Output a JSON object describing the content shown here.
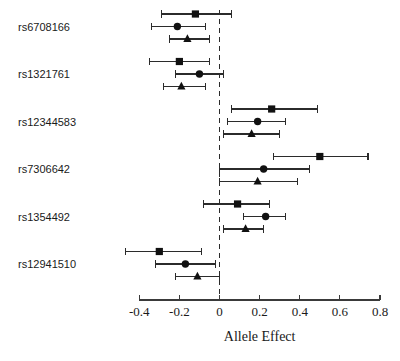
{
  "chart_data": {
    "type": "scatter",
    "subtype": "forest-plot",
    "title": "",
    "xlabel": "Allele Effect",
    "ylabel": "",
    "xlim": [
      -0.5,
      0.8
    ],
    "xticks": [
      -0.4,
      -0.2,
      0,
      0.2,
      0.4,
      0.6,
      0.8
    ],
    "xtick_labels": [
      "-0.4",
      "-0.2",
      "0",
      "0.2",
      "0.4",
      "0.6",
      "0.8"
    ],
    "grid": false,
    "legend": "none",
    "reference_line": {
      "x": 0,
      "style": "dashed"
    },
    "categories": [
      "rs6708166",
      "rs1321761",
      "rs12344583",
      "rs7306642",
      "rs1354492",
      "rs12941510"
    ],
    "series": [
      {
        "name": "square",
        "marker": "square",
        "values": [
          -0.12,
          -0.2,
          0.26,
          0.5,
          0.09,
          -0.3
        ],
        "ci_low": [
          -0.29,
          -0.35,
          0.06,
          0.27,
          -0.08,
          -0.47
        ],
        "ci_high": [
          0.06,
          -0.05,
          0.49,
          0.74,
          0.25,
          -0.09
        ]
      },
      {
        "name": "circle",
        "marker": "circle",
        "values": [
          -0.21,
          -0.1,
          0.19,
          0.22,
          0.23,
          -0.17
        ],
        "ci_low": [
          -0.34,
          -0.22,
          0.04,
          0.0,
          0.12,
          -0.32
        ],
        "ci_high": [
          -0.07,
          0.02,
          0.33,
          0.45,
          0.33,
          -0.02
        ]
      },
      {
        "name": "triangle",
        "marker": "triangle",
        "values": [
          -0.16,
          -0.19,
          0.16,
          0.19,
          0.13,
          -0.11
        ],
        "ci_low": [
          -0.25,
          -0.28,
          0.02,
          0.0,
          0.02,
          -0.22
        ],
        "ci_high": [
          -0.05,
          -0.07,
          0.3,
          0.39,
          0.22,
          0.0
        ]
      }
    ],
    "colors": {
      "marker": "#111111",
      "whisker": "#2b2b2b",
      "axis": "#3a3a3a",
      "reference": "#2b2b2b",
      "background": "#ffffff",
      "text": "#1a1a1a"
    }
  }
}
